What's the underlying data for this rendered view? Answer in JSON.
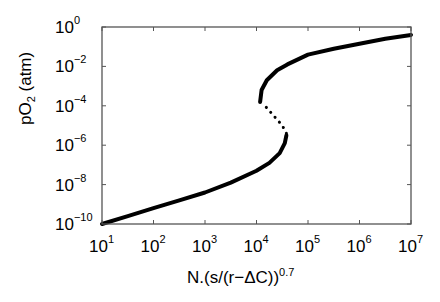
{
  "chart_data": {
    "type": "line",
    "title": "",
    "xlabel": "N.(s/(r−ΔC))^0.7",
    "xlabel_base": "N.(s/(r−ΔC))",
    "xlabel_exp": "0.7",
    "ylabel": "pO2 (atm)",
    "ylabel_base": "pO",
    "ylabel_sub": "2",
    "ylabel_unit": " (atm)",
    "xscale": "log",
    "yscale": "log",
    "xlim": [
      10,
      10000000
    ],
    "ylim": [
      1e-10,
      1
    ],
    "grid": false,
    "legend": null,
    "x_ticks": [
      {
        "base": "10",
        "exp": "1"
      },
      {
        "base": "10",
        "exp": "2"
      },
      {
        "base": "10",
        "exp": "3"
      },
      {
        "base": "10",
        "exp": "4"
      },
      {
        "base": "10",
        "exp": "5"
      },
      {
        "base": "10",
        "exp": "6"
      },
      {
        "base": "10",
        "exp": "7"
      }
    ],
    "y_ticks": [
      {
        "base": "10",
        "exp": "0"
      },
      {
        "base": "10",
        "exp": "−2"
      },
      {
        "base": "10",
        "exp": "−4"
      },
      {
        "base": "10",
        "exp": "−6"
      },
      {
        "base": "10",
        "exp": "−8"
      },
      {
        "base": "10",
        "exp": "−10"
      }
    ],
    "series": [
      {
        "name": "lower stable branch",
        "style": "solid",
        "color": "#000000",
        "log10_points": [
          [
            1.0,
            -10.0
          ],
          [
            1.5,
            -9.6
          ],
          [
            2.0,
            -9.2
          ],
          [
            2.5,
            -8.8
          ],
          [
            3.0,
            -8.4
          ],
          [
            3.5,
            -7.9
          ],
          [
            4.0,
            -7.3
          ],
          [
            4.25,
            -6.9
          ],
          [
            4.45,
            -6.4
          ],
          [
            4.55,
            -5.9
          ],
          [
            4.58,
            -5.5
          ]
        ]
      },
      {
        "name": "unstable branch",
        "style": "dotted",
        "color": "#000000",
        "log10_points": [
          [
            4.58,
            -5.4
          ],
          [
            4.5,
            -5.0
          ],
          [
            4.4,
            -4.7
          ],
          [
            4.3,
            -4.4
          ],
          [
            4.2,
            -4.1
          ],
          [
            4.12,
            -3.9
          ]
        ]
      },
      {
        "name": "upper stable branch",
        "style": "solid",
        "color": "#000000",
        "log10_points": [
          [
            4.07,
            -3.8
          ],
          [
            4.1,
            -3.2
          ],
          [
            4.2,
            -2.7
          ],
          [
            4.4,
            -2.2
          ],
          [
            4.6,
            -1.9
          ],
          [
            5.0,
            -1.4
          ],
          [
            5.5,
            -1.1
          ],
          [
            6.0,
            -0.85
          ],
          [
            6.5,
            -0.6
          ],
          [
            7.0,
            -0.4
          ]
        ]
      }
    ]
  },
  "colors": {
    "axes": "#555555",
    "line": "#000000",
    "background": "#ffffff"
  }
}
